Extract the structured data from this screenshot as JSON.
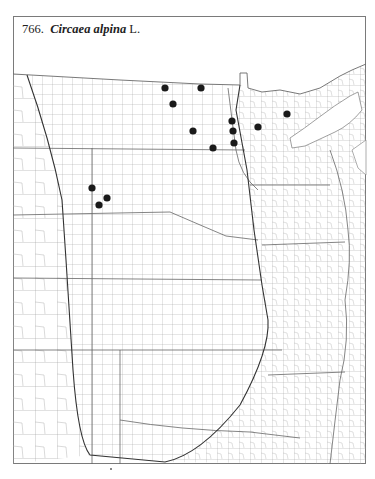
{
  "title": {
    "number": "766.",
    "species": "Circaea alpina",
    "authority": "L."
  },
  "map": {
    "description": "County-level distribution map of the central United States (Great Plains and Upper Midwest)",
    "dot_color": "#1a1a1a",
    "line_color": "#8a8a8a",
    "boundary_color": "#555555",
    "occurrences": [
      {
        "x": 165,
        "y": 88
      },
      {
        "x": 201,
        "y": 88
      },
      {
        "x": 173,
        "y": 104
      },
      {
        "x": 193,
        "y": 131
      },
      {
        "x": 213,
        "y": 148
      },
      {
        "x": 232,
        "y": 121
      },
      {
        "x": 233,
        "y": 131
      },
      {
        "x": 234,
        "y": 143
      },
      {
        "x": 258,
        "y": 127
      },
      {
        "x": 287,
        "y": 114
      },
      {
        "x": 92,
        "y": 188
      },
      {
        "x": 107,
        "y": 198
      },
      {
        "x": 99,
        "y": 205
      }
    ]
  }
}
